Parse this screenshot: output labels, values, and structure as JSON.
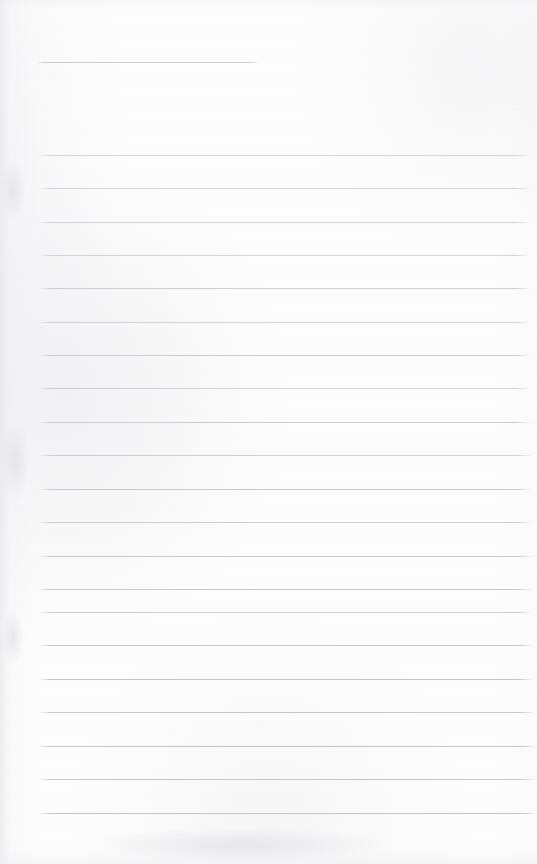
{
  "document": {
    "kind": "scanned-lined-notebook-page",
    "title": "Blank Ruled Notebook Page",
    "page_text": "",
    "handwriting": "",
    "visible_text_content": "none",
    "background_color": "#fdfdfd",
    "rule_color": "#b9b9bd",
    "page_width": 537,
    "page_height": 864,
    "rule_count": 21
  },
  "rules": [
    {
      "name": "rule-header-short",
      "y": 62,
      "x1": 37,
      "x2": 258,
      "opacity": 0.62,
      "color": "#b0b0b6"
    },
    {
      "name": "rule-1",
      "y": 155,
      "x1": 38,
      "x2": 531,
      "opacity": 0.58,
      "color": "#bcbcc0"
    },
    {
      "name": "rule-2",
      "y": 188,
      "x1": 38,
      "x2": 531,
      "opacity": 0.6,
      "color": "#babac0"
    },
    {
      "name": "rule-3",
      "y": 222,
      "x1": 38,
      "x2": 531,
      "opacity": 0.62,
      "color": "#b9b9bf"
    },
    {
      "name": "rule-4",
      "y": 255,
      "x1": 38,
      "x2": 531,
      "opacity": 0.6,
      "color": "#bbbbc1"
    },
    {
      "name": "rule-5",
      "y": 288,
      "x1": 38,
      "x2": 531,
      "opacity": 0.64,
      "color": "#b7b7bd"
    },
    {
      "name": "rule-6",
      "y": 322,
      "x1": 38,
      "x2": 531,
      "opacity": 0.62,
      "color": "#b9b9bf"
    },
    {
      "name": "rule-7",
      "y": 355,
      "x1": 38,
      "x2": 531,
      "opacity": 0.66,
      "color": "#b6b6bc"
    },
    {
      "name": "rule-8",
      "y": 388,
      "x1": 38,
      "x2": 531,
      "opacity": 0.63,
      "color": "#b8b8be"
    },
    {
      "name": "rule-9",
      "y": 422,
      "x1": 38,
      "x2": 531,
      "opacity": 0.66,
      "color": "#b5b5bb"
    },
    {
      "name": "rule-10",
      "y": 455,
      "x1": 38,
      "x2": 532,
      "opacity": 0.64,
      "color": "#b7b7bd"
    },
    {
      "name": "rule-11",
      "y": 489,
      "x1": 38,
      "x2": 532,
      "opacity": 0.68,
      "color": "#b4b4ba"
    },
    {
      "name": "rule-12",
      "y": 522,
      "x1": 38,
      "x2": 532,
      "opacity": 0.66,
      "color": "#b6b6bc"
    },
    {
      "name": "rule-13",
      "y": 556,
      "x1": 38,
      "x2": 533,
      "opacity": 0.7,
      "color": "#b2b2b8"
    },
    {
      "name": "rule-14",
      "y": 589,
      "x1": 38,
      "x2": 533,
      "opacity": 0.68,
      "color": "#b4b4ba"
    },
    {
      "name": "rule-15",
      "y": 612,
      "x1": 38,
      "x2": 533,
      "opacity": 0.66,
      "color": "#b6b6bc"
    },
    {
      "name": "rule-16",
      "y": 645,
      "x1": 38,
      "x2": 534,
      "opacity": 0.7,
      "color": "#b2b2b8"
    },
    {
      "name": "rule-17",
      "y": 679,
      "x1": 38,
      "x2": 534,
      "opacity": 0.72,
      "color": "#b0b0b6"
    },
    {
      "name": "rule-18",
      "y": 712,
      "x1": 38,
      "x2": 535,
      "opacity": 0.7,
      "color": "#b2b2b8"
    },
    {
      "name": "rule-19",
      "y": 746,
      "x1": 38,
      "x2": 536,
      "opacity": 0.74,
      "color": "#aeaeb4"
    },
    {
      "name": "rule-20",
      "y": 779,
      "x1": 38,
      "x2": 536,
      "opacity": 0.72,
      "color": "#b0b0b6"
    },
    {
      "name": "rule-21",
      "y": 813,
      "x1": 38,
      "x2": 537,
      "opacity": 0.74,
      "color": "#aeaeb4"
    }
  ],
  "smudges": [
    {
      "name": "smudge-left-upper",
      "x": 0,
      "y": 160,
      "w": 26,
      "h": 60
    },
    {
      "name": "smudge-left-mid",
      "x": 0,
      "y": 420,
      "w": 30,
      "h": 80
    },
    {
      "name": "smudge-left-lower",
      "x": 2,
      "y": 610,
      "w": 22,
      "h": 54
    },
    {
      "name": "smudge-bottom-band",
      "x": 90,
      "y": 828,
      "w": 300,
      "h": 34
    }
  ]
}
